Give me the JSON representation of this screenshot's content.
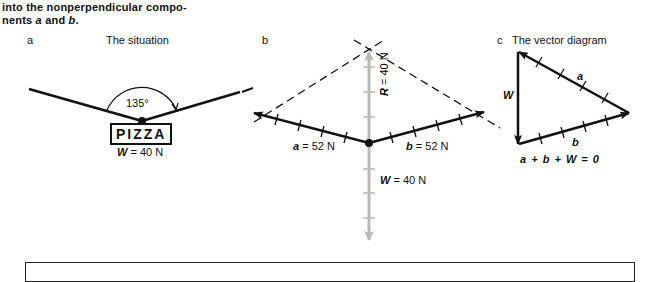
{
  "caption": {
    "line1": "into the nonperpendicular compo-",
    "line2_prefix": "nents ",
    "line2_a": "a",
    "line2_mid": " and ",
    "line2_b": "b",
    "line2_suffix": "."
  },
  "panel_a": {
    "letter": "a",
    "title": "The situation",
    "angle_label": "135°",
    "box_label": "PIZZA",
    "weight_symbol": "W",
    "weight_value": " = 40 N"
  },
  "panel_b": {
    "letter": "b",
    "vector_a_symbol": "a",
    "vector_a_value": " = 52 N",
    "vector_b_symbol": "b",
    "vector_b_value": " = 52 N",
    "resultant_symbol": "R",
    "resultant_value": " = 40 N",
    "weight_symbol": "W",
    "weight_value": " = 40 N"
  },
  "panel_c": {
    "letter": "c",
    "title": "The vector diagram",
    "side_a": "a",
    "side_b": "b",
    "side_w": "W",
    "equation": "a + b + W = 0"
  },
  "colors": {
    "ink": "#111111",
    "resultant_gray": "#b8b8b8"
  }
}
